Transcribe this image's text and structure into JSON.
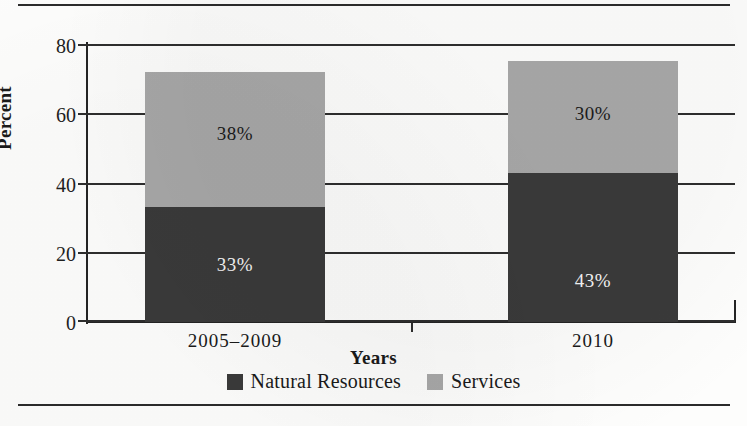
{
  "chart_data": {
    "type": "bar",
    "subtype": "stacked-bar",
    "title": "",
    "xlabel": "Years",
    "ylabel": "Percent",
    "categories": [
      "2005–2009",
      "2010"
    ],
    "series": [
      {
        "name": "Natural Resources",
        "color": "#3a3a3a",
        "values": [
          33,
          43
        ],
        "labels": [
          "33%",
          "43%"
        ]
      },
      {
        "name": "Services",
        "color": "#a8a8a8",
        "values": [
          38,
          30
        ],
        "labels": [
          "38%",
          "30%"
        ]
      }
    ],
    "stack_tops": [
      72,
      75
    ],
    "ylim": [
      0,
      80
    ],
    "yticks": [
      0,
      20,
      40,
      60,
      80
    ],
    "ytick_labels": [
      "0",
      "20",
      "40",
      "60",
      "80"
    ],
    "grid": true,
    "grid_axis": "y",
    "legend_position": "bottom"
  },
  "colors": {
    "natural_resources": "#3a3a3a",
    "services": "#a8a8a8",
    "axis": "#242424",
    "grid": "#2e2e2e",
    "rule": "#2b2b2b",
    "page": "#fdfdfc"
  },
  "legend": {
    "items": [
      {
        "label": "Natural Resources",
        "color": "#3a3a3a"
      },
      {
        "label": "Services",
        "color": "#a8a8a8"
      }
    ]
  }
}
